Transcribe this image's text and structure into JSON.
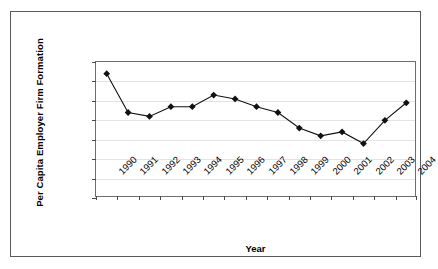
{
  "chart_data": {
    "type": "line",
    "title": "",
    "xlabel": "Year",
    "ylabel": "Per Capita Employer Firm Formation",
    "categories": [
      "1990",
      "1991",
      "1992",
      "1993",
      "1994",
      "1995",
      "1996",
      "1997",
      "1998",
      "1999",
      "2000",
      "2001",
      "2002",
      "2003",
      "2004"
    ],
    "values": [
      0.00234,
      0.00214,
      0.00212,
      0.00217,
      0.00217,
      0.00223,
      0.00221,
      0.00217,
      0.00214,
      0.00206,
      0.00202,
      0.00204,
      0.00198,
      0.0021,
      0.00219
    ],
    "series": [
      {
        "name": "Per Capita Employer Firm Formation",
        "values": [
          0.00234,
          0.00214,
          0.00212,
          0.00217,
          0.00217,
          0.00223,
          0.00221,
          0.00217,
          0.00214,
          0.00206,
          0.00202,
          0.00204,
          0.00198,
          0.0021,
          0.00219
        ]
      }
    ],
    "ylim": [
      0.0017,
      0.0024
    ],
    "ytick_labels": [
      "0.0024",
      "0.0023",
      "0.0022",
      "0.0021",
      "0.0020",
      "0.0019",
      "0.0018",
      "0.0017"
    ],
    "ytick_values": [
      0.0024,
      0.0023,
      0.0022,
      0.0021,
      0.002,
      0.0019,
      0.0018,
      0.0017
    ],
    "grid": true,
    "legend": "none",
    "marker": "diamond",
    "line_color": "#111111",
    "marker_color": "#111111",
    "gridline_color": "#e3e3e3",
    "axis_color": "#6e6e6e",
    "border_color": "#5a5a5a",
    "background": "#ffffff"
  }
}
